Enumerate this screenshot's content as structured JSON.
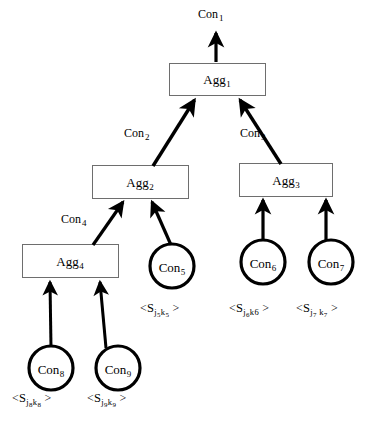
{
  "diagram": {
    "colors": {
      "stroke": "#000000",
      "background": "#ffffff",
      "box_fill": "#ffffff",
      "box_border": "#6e6e6e",
      "circle_border": "#000000",
      "arrow": "#000000"
    },
    "aggregators": [
      {
        "id": "agg1",
        "label": "Agg",
        "sub": "1",
        "x": 169,
        "y": 63,
        "w": 97,
        "h": 33
      },
      {
        "id": "agg2",
        "label": "Agg",
        "sub": "2",
        "x": 92,
        "y": 165,
        "w": 97,
        "h": 34
      },
      {
        "id": "agg3",
        "label": "Agg",
        "sub": "3",
        "x": 239,
        "y": 163,
        "w": 94,
        "h": 34
      },
      {
        "id": "agg4",
        "label": "Agg",
        "sub": "4",
        "x": 22,
        "y": 244,
        "w": 97,
        "h": 34
      }
    ],
    "consumers": [
      {
        "id": "con5",
        "label": "Con",
        "sub": "5",
        "cx": 172,
        "cy": 266,
        "r": 22
      },
      {
        "id": "con6",
        "label": "Con",
        "sub": "6",
        "cx": 263,
        "cy": 262,
        "r": 22
      },
      {
        "id": "con7",
        "label": "Con",
        "sub": "7",
        "cx": 331,
        "cy": 262,
        "r": 22
      },
      {
        "id": "con8",
        "label": "Con",
        "sub": "8",
        "cx": 51,
        "cy": 368,
        "r": 22
      },
      {
        "id": "con9",
        "label": "Con",
        "sub": "9",
        "cx": 118,
        "cy": 368,
        "r": 22
      }
    ],
    "edge_labels": [
      {
        "id": "con1",
        "label": "Con",
        "sub": "1",
        "x": 198,
        "y": 8
      },
      {
        "id": "con2",
        "label": "Con",
        "sub": "2",
        "x": 124,
        "y": 127
      },
      {
        "id": "con3",
        "label": "Con",
        "sub": "3",
        "x": 239,
        "y": 127
      },
      {
        "id": "con4",
        "label": "Con",
        "sub": "4",
        "x": 60,
        "y": 214
      }
    ],
    "sensor_labels": [
      {
        "id": "sensor5",
        "open": "<",
        "s": "S",
        "j": "j",
        "jn": "5",
        "k": "k",
        "kn": "5",
        "close": ">",
        "x": 140,
        "y": 302
      },
      {
        "id": "sensor6",
        "open": "<",
        "s": "S",
        "j": "j",
        "jn": "6",
        "k": "k",
        "kn": "6",
        "close": ">",
        "x": 229,
        "y": 302
      },
      {
        "id": "sensor7",
        "open": "<",
        "s": "S",
        "j": "j",
        "jn": "7",
        "k": "k",
        "kn": "7",
        "close": ">",
        "x": 296,
        "y": 302
      },
      {
        "id": "sensor8",
        "open": "<",
        "s": "S",
        "j": "j",
        "jn": "8",
        "k": "k",
        "kn": "8",
        "close": ">",
        "x": 12,
        "y": 392
      },
      {
        "id": "sensor9",
        "open": "<",
        "s": "S",
        "j": "j",
        "jn": "9",
        "k": "k",
        "kn": "9",
        "close": ">",
        "x": 87,
        "y": 392
      }
    ],
    "arrows": [
      {
        "id": "arrow-agg1-out",
        "from": "agg1",
        "to": "con1-out",
        "x1": 216,
        "y1": 62,
        "x2": 216,
        "y2": 31,
        "style": "straight"
      },
      {
        "id": "arrow-agg2-agg1",
        "from": "agg2",
        "to": "agg1",
        "x1": 153,
        "y1": 165,
        "x2": 194,
        "y2": 99,
        "style": "diagonal"
      },
      {
        "id": "arrow-agg3-agg1",
        "from": "agg3",
        "to": "agg1",
        "x1": 281,
        "y1": 163,
        "x2": 240,
        "y2": 99,
        "style": "diagonal"
      },
      {
        "id": "arrow-agg4-agg2",
        "from": "agg4",
        "to": "agg2",
        "x1": 93,
        "y1": 244,
        "x2": 123,
        "y2": 201,
        "style": "diagonal"
      },
      {
        "id": "arrow-con5-agg2",
        "from": "con5",
        "to": "agg2",
        "x1": 172,
        "y1": 244,
        "x2": 152,
        "y2": 201,
        "style": "diagonal"
      },
      {
        "id": "arrow-con6-agg3",
        "from": "con6",
        "to": "agg3",
        "x1": 263,
        "y1": 240,
        "x2": 263,
        "y2": 199,
        "style": "straight"
      },
      {
        "id": "arrow-con7-agg3",
        "from": "con7",
        "to": "agg3",
        "x1": 326,
        "y1": 240,
        "x2": 326,
        "y2": 199,
        "style": "straight"
      },
      {
        "id": "arrow-con8-agg4",
        "from": "con8",
        "to": "agg4",
        "x1": 51,
        "y1": 346,
        "x2": 50,
        "y2": 281,
        "style": "straight"
      },
      {
        "id": "arrow-con9-agg4",
        "from": "con9",
        "to": "agg4",
        "x1": 104,
        "y1": 346,
        "x2": 100,
        "y2": 281,
        "style": "straight"
      }
    ]
  }
}
